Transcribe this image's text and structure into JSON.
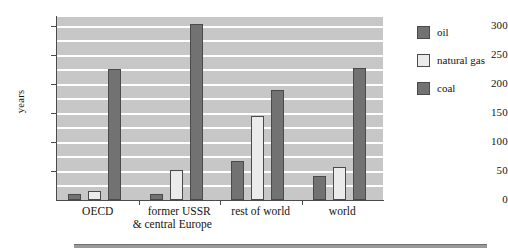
{
  "chart_data": {
    "type": "bar",
    "title": "",
    "subtitle": "",
    "xlabel": "",
    "ylabel": "years",
    "ylim": [
      0,
      315
    ],
    "yticks": [
      0,
      50,
      100,
      150,
      200,
      250,
      300
    ],
    "ytick_labels": [
      "0",
      "50",
      "100",
      "150",
      "200",
      "250",
      "300"
    ],
    "grid": true,
    "grid_interval": 25,
    "legend_position": "right",
    "categories": [
      "OECD",
      "former USSR & central Europe",
      "rest of world",
      "world"
    ],
    "category_lines": [
      [
        "OECD",
        ""
      ],
      [
        "former USSR",
        "& central Europe"
      ],
      [
        "rest of world",
        ""
      ],
      [
        "world",
        ""
      ]
    ],
    "series": [
      {
        "name": "oil",
        "color": "#727272",
        "values": [
          10,
          11,
          67,
          42
        ]
      },
      {
        "name": "natural gas",
        "color": "#ebebeb",
        "values": [
          15,
          52,
          145,
          56
        ]
      },
      {
        "name": "coal",
        "color": "#727272",
        "values": [
          225,
          303,
          190,
          228
        ]
      }
    ],
    "plot_background": "#c7c7c7",
    "gridline_color": "#ffffff",
    "axis_color": "#4b4b4b"
  },
  "legend": {
    "items": [
      {
        "label": "oil"
      },
      {
        "label": "natural gas"
      },
      {
        "label": "coal"
      }
    ]
  }
}
